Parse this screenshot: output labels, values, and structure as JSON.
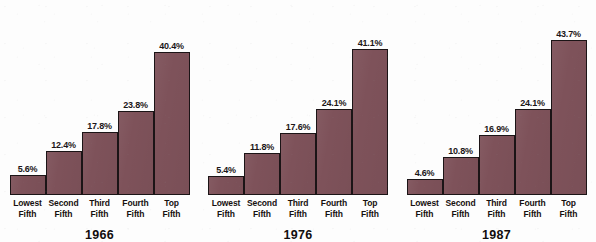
{
  "chart_data": {
    "type": "bar",
    "title": "",
    "subtitle": "",
    "xlabel": "",
    "ylabel": "",
    "grid": false,
    "legend_position": "none",
    "ylim": [
      0,
      45
    ],
    "categories": [
      "Lowest Fifth",
      "Second Fifth",
      "Third Fifth",
      "Fourth Fifth",
      "Top Fifth"
    ],
    "groups": [
      "1966",
      "1976",
      "1987"
    ],
    "series": [
      {
        "name": "1966",
        "values": [
          5.6,
          12.4,
          17.8,
          23.8,
          40.4
        ]
      },
      {
        "name": "1976",
        "values": [
          5.4,
          11.8,
          17.6,
          24.1,
          41.1
        ]
      },
      {
        "name": "1987",
        "values": [
          4.6,
          10.8,
          16.9,
          24.1,
          43.7
        ]
      }
    ],
    "value_labels": [
      [
        "5.6%",
        "12.4%",
        "17.8%",
        "23.8%",
        "40.4%"
      ],
      [
        "5.4%",
        "11.8%",
        "17.6%",
        "24.1%",
        "41.1%"
      ],
      [
        "4.6%",
        "10.8%",
        "16.9%",
        "24.1%",
        "43.7%"
      ]
    ],
    "colors": {
      "bar_fill": "#7e525a",
      "bar_stroke": "#1b1416",
      "background": "#fdfdfd",
      "text": "#16100f"
    }
  },
  "groups": [
    {
      "year": "1966",
      "bars": [
        {
          "label_line1": "Lowest",
          "label_line2": "Fifth",
          "value": "5.6%",
          "pct": 5.6
        },
        {
          "label_line1": "Second",
          "label_line2": "Fifth",
          "value": "12.4%",
          "pct": 12.4
        },
        {
          "label_line1": "Third",
          "label_line2": "Fifth",
          "value": "17.8%",
          "pct": 17.8
        },
        {
          "label_line1": "Fourth",
          "label_line2": "Fifth",
          "value": "23.8%",
          "pct": 23.8
        },
        {
          "label_line1": "Top",
          "label_line2": "Fifth",
          "value": "40.4%",
          "pct": 40.4
        }
      ]
    },
    {
      "year": "1976",
      "bars": [
        {
          "label_line1": "Lowest",
          "label_line2": "Fifth",
          "value": "5.4%",
          "pct": 5.4
        },
        {
          "label_line1": "Second",
          "label_line2": "Fifth",
          "value": "11.8%",
          "pct": 11.8
        },
        {
          "label_line1": "Third",
          "label_line2": "Fifth",
          "value": "17.6%",
          "pct": 17.6
        },
        {
          "label_line1": "Fourth",
          "label_line2": "Fifth",
          "value": "24.1%",
          "pct": 24.1
        },
        {
          "label_line1": "Top",
          "label_line2": "Fifth",
          "value": "41.1%",
          "pct": 41.1
        }
      ]
    },
    {
      "year": "1987",
      "bars": [
        {
          "label_line1": "Lowest",
          "label_line2": "Fifth",
          "value": "4.6%",
          "pct": 4.6
        },
        {
          "label_line1": "Second",
          "label_line2": "Fifth",
          "value": "10.8%",
          "pct": 10.8
        },
        {
          "label_line1": "Third",
          "label_line2": "Fifth",
          "value": "16.9%",
          "pct": 16.9
        },
        {
          "label_line1": "Fourth",
          "label_line2": "Fifth",
          "value": "24.1%",
          "pct": 24.1
        },
        {
          "label_line1": "Top",
          "label_line2": "Fifth",
          "value": "43.7%",
          "pct": 43.7
        }
      ]
    }
  ]
}
